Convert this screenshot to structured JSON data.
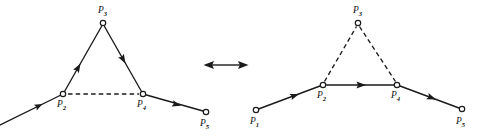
{
  "figure": {
    "background_color": "#ffffff",
    "ink_color": "#1a1a1a",
    "width": 492,
    "height": 136,
    "relation_symbol": "double-headed-arrow",
    "relation_meaning": "equivalent-to"
  },
  "panels": [
    {
      "id": "left",
      "name": "left-configuration",
      "description": "Path with solid detour through apex P3; chord P2-P4 dashed",
      "nodes": [
        {
          "id": "P1",
          "label": "P",
          "subscript": "1",
          "x": -6,
          "y": 128,
          "visible_circle": false
        },
        {
          "id": "P2",
          "label": "P",
          "subscript": "2",
          "x": 63,
          "y": 94,
          "visible_circle": true
        },
        {
          "id": "P3",
          "label": "P",
          "subscript": "3",
          "x": 103,
          "y": 23,
          "visible_circle": true
        },
        {
          "id": "P4",
          "label": "P",
          "subscript": "4",
          "x": 143,
          "y": 94,
          "visible_circle": true
        },
        {
          "id": "P5",
          "label": "P",
          "subscript": "5",
          "x": 206,
          "y": 112,
          "visible_circle": true
        }
      ],
      "edges": [
        {
          "from": "P1",
          "to": "P2",
          "style": "solid",
          "arrow": true
        },
        {
          "from": "P2",
          "to": "P3",
          "style": "solid",
          "arrow": true
        },
        {
          "from": "P3",
          "to": "P4",
          "style": "solid",
          "arrow": true
        },
        {
          "from": "P2",
          "to": "P4",
          "style": "dashed",
          "arrow": false
        },
        {
          "from": "P4",
          "to": "P5",
          "style": "solid",
          "arrow": true
        }
      ]
    },
    {
      "id": "right",
      "name": "right-configuration",
      "description": "Path routed straight along chord P2-P4 solid; detour through apex P3 dashed",
      "nodes": [
        {
          "id": "P1",
          "label": "P",
          "subscript": "1",
          "x": 256,
          "y": 110,
          "visible_circle": true
        },
        {
          "id": "P2",
          "label": "P",
          "subscript": "2",
          "x": 323,
          "y": 85,
          "visible_circle": true
        },
        {
          "id": "P3",
          "label": "P",
          "subscript": "3",
          "x": 358,
          "y": 23,
          "visible_circle": true
        },
        {
          "id": "P4",
          "label": "P",
          "subscript": "4",
          "x": 397,
          "y": 85,
          "visible_circle": true
        },
        {
          "id": "P5",
          "label": "P",
          "subscript": "5",
          "x": 462,
          "y": 109,
          "visible_circle": true
        }
      ],
      "edges": [
        {
          "from": "P1",
          "to": "P2",
          "style": "solid",
          "arrow": true
        },
        {
          "from": "P2",
          "to": "P3",
          "style": "dashed",
          "arrow": false
        },
        {
          "from": "P3",
          "to": "P4",
          "style": "dashed",
          "arrow": false
        },
        {
          "from": "P2",
          "to": "P4",
          "style": "solid",
          "arrow": true
        },
        {
          "from": "P4",
          "to": "P5",
          "style": "solid",
          "arrow": true
        }
      ]
    }
  ],
  "relation": {
    "name": "equivalence-arrow",
    "x1": 204,
    "x2": 248,
    "y": 65
  }
}
